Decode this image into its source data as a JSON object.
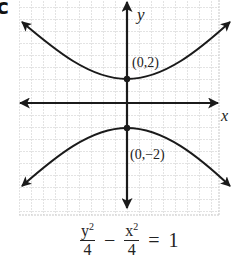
{
  "figure": {
    "part_label": "c",
    "axes": {
      "x_label": "x",
      "y_label": "y"
    },
    "points": [
      {
        "label": "(0,2)",
        "x": 0,
        "y": 2
      },
      {
        "label": "(0,−2)",
        "x": 0,
        "y": -2
      }
    ],
    "equation": {
      "term1_num": "y",
      "term1_exp": "2",
      "term1_den": "4",
      "operator": "−",
      "term2_num": "x",
      "term2_exp": "2",
      "term2_den": "4",
      "equals": "=",
      "rhs": "1"
    },
    "colors": {
      "grid": "#c8c8c8",
      "ink": "#1a1a1a"
    }
  }
}
